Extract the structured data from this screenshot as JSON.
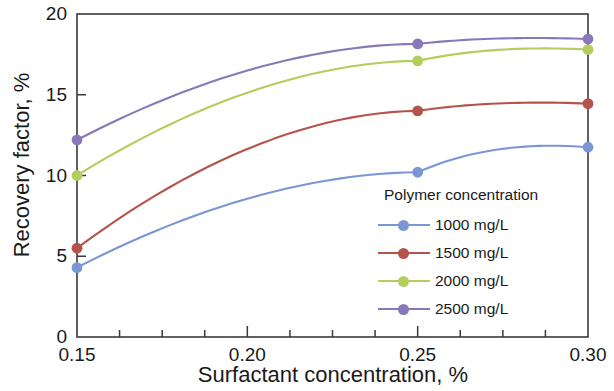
{
  "chart_data": {
    "type": "line",
    "title": "",
    "xlabel": "Surfactant concentration, %",
    "ylabel": "Recovery factor, %",
    "xlim": [
      0.15,
      0.3
    ],
    "ylim": [
      0,
      20
    ],
    "xticks": [
      "0.15",
      "0.20",
      "0.25",
      "0.30"
    ],
    "xtick_values": [
      0.15,
      0.2,
      0.25,
      0.3
    ],
    "yticks": [
      "0",
      "5",
      "10",
      "15",
      "20"
    ],
    "ytick_values": [
      0,
      5,
      10,
      15,
      20
    ],
    "grid": false,
    "legend_position": "inside-lower-right",
    "legend_title": "Polymer concentration",
    "x": [
      0.15,
      0.25,
      0.3
    ],
    "series": [
      {
        "name": "1000 mg/L",
        "color": "#7b96d4",
        "values": [
          4.3,
          10.2,
          11.75
        ],
        "marker": "circle"
      },
      {
        "name": "1500 mg/L",
        "color": "#b5544a",
        "values": [
          5.5,
          14.0,
          14.45
        ],
        "marker": "circle"
      },
      {
        "name": "2000 mg/L",
        "color": "#b5cc5e",
        "values": [
          10.0,
          17.1,
          17.8
        ],
        "marker": "circle"
      },
      {
        "name": "2500 mg/L",
        "color": "#8878b8",
        "values": [
          12.2,
          18.15,
          18.45
        ],
        "marker": "circle"
      }
    ]
  },
  "axis": {
    "x_title": "Surfactant concentration, %",
    "y_title": "Recovery factor, %",
    "x_tick_0": "0.15",
    "x_tick_1": "0.20",
    "x_tick_2": "0.25",
    "x_tick_3": "0.30",
    "y_tick_0": "0",
    "y_tick_1": "5",
    "y_tick_2": "10",
    "y_tick_3": "15",
    "y_tick_4": "20"
  },
  "legend": {
    "title": "Polymer concentration",
    "items": [
      {
        "label": "1000 mg/L",
        "color": "#7b96d4"
      },
      {
        "label": "1500 mg/L",
        "color": "#b5544a"
      },
      {
        "label": "2000 mg/L",
        "color": "#b5cc5e"
      },
      {
        "label": "2500 mg/L",
        "color": "#8878b8"
      }
    ]
  }
}
